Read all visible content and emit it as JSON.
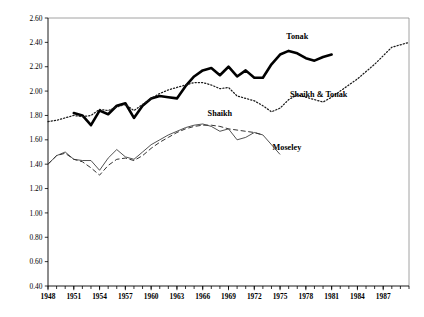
{
  "chart_data": {
    "type": "line",
    "title": "",
    "xlabel": "",
    "ylabel": "",
    "xlim": [
      1948,
      1990
    ],
    "ylim": [
      0.4,
      2.6
    ],
    "grid": false,
    "legend": "inline-annotations",
    "ytick_labels": [
      "2.60",
      "2.40",
      "2.20",
      "2.00",
      "1.80",
      "1.60",
      "1.40",
      "1.20",
      "1.00",
      "0.80",
      "0.60",
      "0.40"
    ],
    "ytick_values": [
      2.6,
      2.4,
      2.2,
      2.0,
      1.8,
      1.6,
      1.4,
      1.2,
      1.0,
      0.8,
      0.6,
      0.4
    ],
    "xtick_labels": [
      "1948",
      "1951",
      "1954",
      "1957",
      "1960",
      "1963",
      "1966",
      "1969",
      "1972",
      "1975",
      "1978",
      "1981",
      "1984",
      "1987"
    ],
    "xtick_values": [
      1948,
      1951,
      1954,
      1957,
      1960,
      1963,
      1966,
      1969,
      1972,
      1975,
      1978,
      1981,
      1984,
      1987
    ],
    "xtick_minor_step": 1,
    "series": [
      {
        "name": "Tonak",
        "style": "thick-solid",
        "color": "#000000",
        "x": [
          1951,
          1952,
          1953,
          1954,
          1955,
          1956,
          1957,
          1958,
          1959,
          1960,
          1961,
          1962,
          1963,
          1964,
          1965,
          1966,
          1967,
          1968,
          1969,
          1970,
          1971,
          1972,
          1973,
          1974,
          1975,
          1976,
          1977,
          1978,
          1979,
          1980,
          1981
        ],
        "values": [
          1.82,
          1.8,
          1.72,
          1.84,
          1.81,
          1.88,
          1.9,
          1.78,
          1.88,
          1.94,
          1.96,
          1.95,
          1.94,
          2.04,
          2.12,
          2.17,
          2.19,
          2.13,
          2.2,
          2.12,
          2.17,
          2.11,
          2.11,
          2.22,
          2.3,
          2.33,
          2.31,
          2.27,
          2.25,
          2.28,
          2.3
        ]
      },
      {
        "name": "Shaikh & Tonak",
        "style": "dotted",
        "color": "#1a1a1a",
        "x": [
          1948,
          1949,
          1950,
          1951,
          1952,
          1953,
          1954,
          1955,
          1956,
          1957,
          1958,
          1959,
          1960,
          1961,
          1962,
          1963,
          1964,
          1965,
          1966,
          1967,
          1968,
          1969,
          1970,
          1971,
          1972,
          1973,
          1974,
          1975,
          1976,
          1977,
          1978,
          1979,
          1980,
          1981,
          1982,
          1983,
          1984,
          1985,
          1986,
          1987,
          1988,
          1989,
          1990
        ],
        "values": [
          1.75,
          1.76,
          1.78,
          1.8,
          1.79,
          1.8,
          1.85,
          1.84,
          1.87,
          1.89,
          1.84,
          1.89,
          1.94,
          1.98,
          2.01,
          2.03,
          2.05,
          2.07,
          2.07,
          2.05,
          2.02,
          2.03,
          1.96,
          1.94,
          1.92,
          1.88,
          1.83,
          1.86,
          1.93,
          1.97,
          1.95,
          1.93,
          1.91,
          1.95,
          2.0,
          2.05,
          2.1,
          2.16,
          2.22,
          2.29,
          2.36,
          2.38,
          2.4
        ]
      },
      {
        "name": "Shaikh",
        "style": "dashed",
        "color": "#333333",
        "x": [
          1948,
          1949,
          1950,
          1951,
          1952,
          1953,
          1954,
          1955,
          1956,
          1957,
          1958,
          1959,
          1960,
          1961,
          1962,
          1963,
          1964,
          1965,
          1966,
          1967,
          1968,
          1969,
          1970,
          1971,
          1972,
          1973
        ],
        "values": [
          1.4,
          1.47,
          1.49,
          1.44,
          1.42,
          1.37,
          1.31,
          1.39,
          1.44,
          1.45,
          1.43,
          1.47,
          1.53,
          1.58,
          1.62,
          1.66,
          1.69,
          1.71,
          1.72,
          1.72,
          1.71,
          1.69,
          1.68,
          1.67,
          1.66,
          1.64
        ]
      },
      {
        "name": "Moseley",
        "style": "thin-solid",
        "color": "#333333",
        "x": [
          1948,
          1949,
          1950,
          1951,
          1952,
          1953,
          1954,
          1955,
          1956,
          1957,
          1958,
          1959,
          1960,
          1961,
          1962,
          1963,
          1964,
          1965,
          1966,
          1967,
          1968,
          1969,
          1970,
          1971,
          1972,
          1973,
          1974,
          1975
        ],
        "values": [
          1.4,
          1.47,
          1.5,
          1.44,
          1.43,
          1.43,
          1.35,
          1.45,
          1.52,
          1.46,
          1.44,
          1.5,
          1.56,
          1.6,
          1.64,
          1.67,
          1.7,
          1.72,
          1.73,
          1.71,
          1.67,
          1.69,
          1.6,
          1.62,
          1.66,
          1.64,
          1.56,
          1.48
        ]
      }
    ],
    "annotations": [
      {
        "text": "Tonak",
        "x": 1977.0,
        "y": 2.425
      },
      {
        "text": "Shaikh & Tonak",
        "x": 1979.5,
        "y": 1.955
      },
      {
        "text": "Shaikh",
        "x": 1968.0,
        "y": 1.795
      },
      {
        "text": "Moseley",
        "x": 1975.8,
        "y": 1.515
      }
    ]
  }
}
